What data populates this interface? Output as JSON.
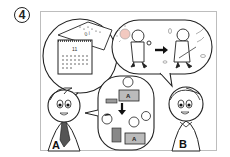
{
  "panel": {
    "number": "4",
    "characters": [
      {
        "id": "A",
        "label": "A",
        "tie_color": "#555555"
      },
      {
        "id": "B",
        "label": "B"
      }
    ],
    "bubbles": [
      {
        "name": "calendar-bubble",
        "content": "calendar with torn page",
        "calendar_header": "11"
      },
      {
        "name": "season-change-bubble",
        "content": "person walking in sun, arrow, person in cold wind"
      },
      {
        "name": "office-bubble",
        "content": "office workers at desks with laptops",
        "laptop_labels": [
          "A",
          "A"
        ]
      }
    ],
    "colors": {
      "line": "#222222",
      "sun": "#f2c9c0",
      "frame_border": "#bdbdbd",
      "gray_fill": "#9a9a9a"
    }
  }
}
